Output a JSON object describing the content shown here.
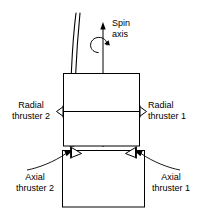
{
  "diagram": {
    "stroke_color": "#000000",
    "fill_color": "#ffffff",
    "background": "#ffffff"
  },
  "labels": {
    "spin_axis_line1": "Spin",
    "spin_axis_line2": "axis",
    "radial_thruster_2_line1": "Radial",
    "radial_thruster_2_line2": "thruster 2",
    "radial_thruster_1_line1": "Radial",
    "radial_thruster_1_line2": "thruster 1",
    "axial_thruster_2_line1": "Axial",
    "axial_thruster_2_line2": "thruster 2",
    "axial_thruster_1_line1": "Axial",
    "axial_thruster_1_line2": "thruster 1"
  },
  "parts": {
    "upper_body_name": "upper-spacecraft-body",
    "lower_body_name": "lower-spacecraft-body",
    "boom_name": "antenna-boom",
    "spin_axis_arrow_name": "spin-axis-arrow",
    "rotation_arc_name": "rotation-direction-arc",
    "radial_axis_line_name": "radial-axis-line",
    "radial_thruster_left_name": "radial-thruster-2-nozzle",
    "radial_thruster_right_name": "radial-thruster-1-nozzle",
    "axial_thruster_left_name": "axial-thruster-2-nozzle",
    "axial_thruster_right_name": "axial-thruster-1-nozzle",
    "leader_left_name": "axial-thruster-2-leader",
    "leader_right_name": "axial-thruster-1-leader"
  }
}
